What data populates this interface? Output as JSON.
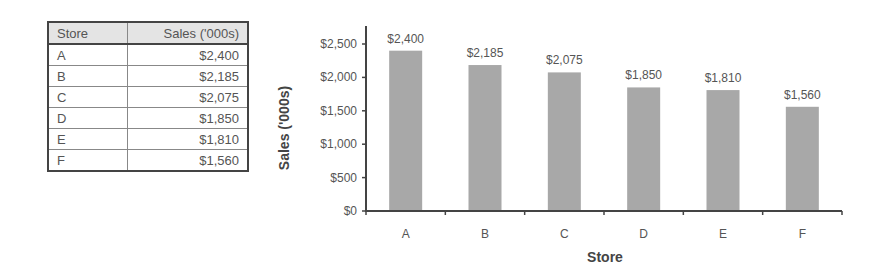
{
  "table": {
    "headers": [
      "Store",
      "Sales ('000s)"
    ],
    "rows": [
      [
        "A",
        "$2,400"
      ],
      [
        "B",
        "$2,185"
      ],
      [
        "C",
        "$2,075"
      ],
      [
        "D",
        "$1,850"
      ],
      [
        "E",
        "$1,810"
      ],
      [
        "F",
        "$1,560"
      ]
    ]
  },
  "chart_data": {
    "type": "bar",
    "title": "",
    "xlabel": "Store",
    "ylabel": "Sales ('000s)",
    "categories": [
      "A",
      "B",
      "C",
      "D",
      "E",
      "F"
    ],
    "values": [
      2400,
      2185,
      2075,
      1850,
      1810,
      1560
    ],
    "data_labels": [
      "$2,400",
      "$2,185",
      "$2,075",
      "$1,850",
      "$1,810",
      "$1,560"
    ],
    "yticks": [
      0,
      500,
      1000,
      1500,
      2000,
      2500
    ],
    "ytick_labels": [
      "$0",
      "$500",
      "$1,000",
      "$1,500",
      "$2,000",
      "$2,500"
    ],
    "ylim": [
      0,
      2500
    ],
    "grid": false,
    "legend": null,
    "bar_color": "#a8a8a8"
  }
}
